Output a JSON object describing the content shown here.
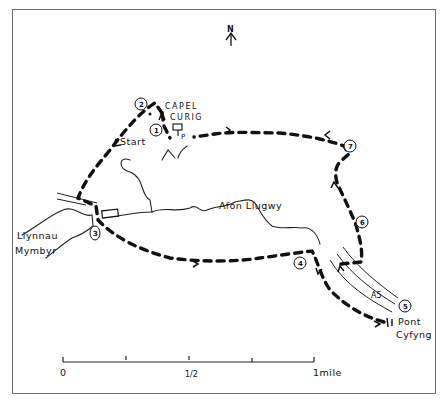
{
  "map": {
    "type": "hand-drawn walking route map",
    "north_label": "N",
    "labels": {
      "village": [
        "CAPEL",
        "CURIG"
      ],
      "start": "Start",
      "river": "Afon Llugwy",
      "lake": [
        "Llynnau",
        "Mymbyr"
      ],
      "bridge": [
        "Pont",
        "Cyfyng"
      ],
      "road": "A5",
      "parking": "P"
    },
    "waypoints": [
      {
        "id": "1",
        "label": "1"
      },
      {
        "id": "2",
        "label": "2"
      },
      {
        "id": "3",
        "label": "3"
      },
      {
        "id": "4",
        "label": "4"
      },
      {
        "id": "5",
        "label": "5"
      },
      {
        "id": "6",
        "label": "6"
      },
      {
        "id": "7",
        "label": "7"
      }
    ],
    "scale_bar": {
      "start_label": "0",
      "mid_label": "1/2",
      "end_label": "1mile"
    },
    "colors": {
      "ink": "#111111",
      "paper": "#ffffff",
      "frame": "#6a6a6a"
    }
  }
}
